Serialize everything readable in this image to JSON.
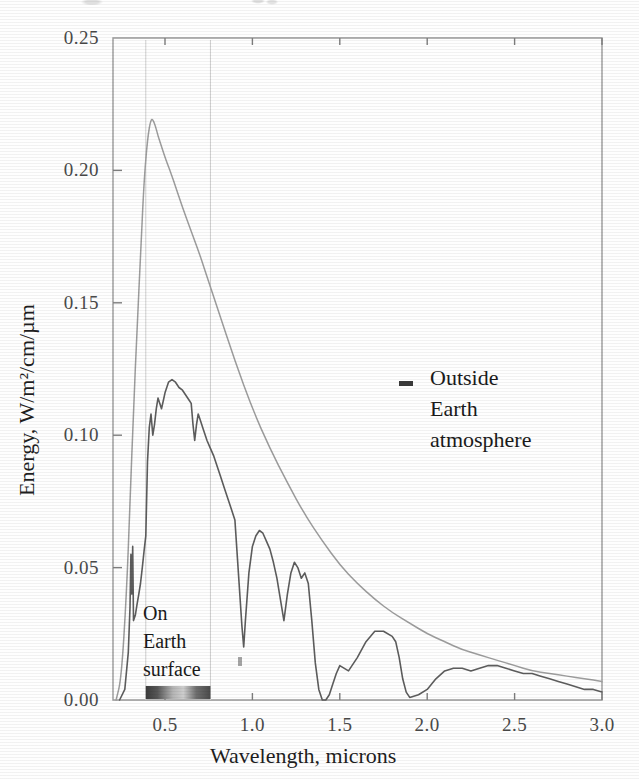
{
  "chart_data": {
    "type": "line",
    "title": "",
    "xlabel": "Wavelength, microns",
    "ylabel": "Energy, W/m²/cm/µm",
    "xlim": [
      0.2,
      3.0
    ],
    "ylim": [
      0.0,
      0.25
    ],
    "grid": "visible-band-only",
    "legend_position": "inline-annotations",
    "xticks": [
      "0.5",
      "1.0",
      "1.5",
      "2.0",
      "2.5",
      "3.0"
    ],
    "xtick_values": [
      0.5,
      1.0,
      1.5,
      2.0,
      2.5,
      3.0
    ],
    "yticks": [
      "0.00",
      "0.05",
      "0.10",
      "0.15",
      "0.20",
      "0.25"
    ],
    "ytick_values": [
      0.0,
      0.05,
      0.1,
      0.15,
      0.2,
      0.25
    ],
    "visible_band": {
      "label": "visible spectrum bar",
      "start": 0.39,
      "end": 0.76
    },
    "annotations": [
      {
        "name": "outside-earth-atmosphere",
        "lines": [
          "Outside",
          "Earth",
          "atmosphere"
        ],
        "x": 1.3,
        "y": 0.125
      },
      {
        "name": "on-earth-surface",
        "lines": [
          "On",
          "Earth",
          "surface"
        ],
        "x": 0.43,
        "y": 0.035
      }
    ],
    "series": [
      {
        "name": "Outside Earth atmosphere",
        "color": "#9d9d9d",
        "x": [
          0.22,
          0.25,
          0.28,
          0.3,
          0.32,
          0.34,
          0.36,
          0.38,
          0.4,
          0.42,
          0.44,
          0.46,
          0.48,
          0.5,
          0.55,
          0.6,
          0.65,
          0.7,
          0.75,
          0.8,
          0.9,
          1.0,
          1.1,
          1.2,
          1.3,
          1.4,
          1.5,
          1.6,
          1.7,
          1.8,
          1.9,
          2.0,
          2.1,
          2.2,
          2.3,
          2.4,
          2.5,
          2.6,
          2.7,
          2.8,
          2.9,
          3.0
        ],
        "y": [
          0.0,
          0.008,
          0.04,
          0.075,
          0.11,
          0.14,
          0.168,
          0.196,
          0.212,
          0.22,
          0.218,
          0.213,
          0.209,
          0.205,
          0.196,
          0.186,
          0.177,
          0.168,
          0.158,
          0.148,
          0.128,
          0.11,
          0.095,
          0.082,
          0.07,
          0.06,
          0.051,
          0.044,
          0.038,
          0.033,
          0.029,
          0.025,
          0.022,
          0.019,
          0.017,
          0.015,
          0.013,
          0.011,
          0.01,
          0.009,
          0.008,
          0.007
        ]
      },
      {
        "name": "On Earth surface",
        "color": "#5d5d5d",
        "x": [
          0.24,
          0.27,
          0.29,
          0.3,
          0.305,
          0.31,
          0.315,
          0.32,
          0.33,
          0.34,
          0.35,
          0.36,
          0.37,
          0.38,
          0.39,
          0.4,
          0.41,
          0.42,
          0.43,
          0.44,
          0.45,
          0.46,
          0.47,
          0.48,
          0.49,
          0.5,
          0.52,
          0.54,
          0.56,
          0.58,
          0.6,
          0.62,
          0.64,
          0.65,
          0.66,
          0.67,
          0.68,
          0.69,
          0.7,
          0.72,
          0.74,
          0.76,
          0.78,
          0.8,
          0.82,
          0.84,
          0.86,
          0.88,
          0.9,
          0.92,
          0.94,
          0.95,
          0.96,
          0.98,
          1.0,
          1.02,
          1.04,
          1.06,
          1.08,
          1.1,
          1.12,
          1.14,
          1.16,
          1.18,
          1.2,
          1.22,
          1.24,
          1.26,
          1.28,
          1.3,
          1.32,
          1.34,
          1.36,
          1.38,
          1.4,
          1.42,
          1.44,
          1.46,
          1.48,
          1.5,
          1.55,
          1.6,
          1.65,
          1.7,
          1.75,
          1.8,
          1.82,
          1.84,
          1.86,
          1.88,
          1.9,
          1.95,
          2.0,
          2.05,
          2.1,
          2.15,
          2.2,
          2.25,
          2.3,
          2.35,
          2.4,
          2.45,
          2.5,
          2.55,
          2.6,
          2.65,
          2.7,
          2.75,
          2.8,
          2.85,
          2.9,
          2.95,
          3.0
        ],
        "y": [
          0.0,
          0.004,
          0.018,
          0.035,
          0.055,
          0.04,
          0.058,
          0.03,
          0.032,
          0.036,
          0.04,
          0.044,
          0.05,
          0.056,
          0.062,
          0.09,
          0.103,
          0.108,
          0.1,
          0.104,
          0.11,
          0.114,
          0.112,
          0.11,
          0.113,
          0.116,
          0.12,
          0.121,
          0.12,
          0.118,
          0.117,
          0.115,
          0.113,
          0.112,
          0.104,
          0.098,
          0.104,
          0.108,
          0.106,
          0.102,
          0.098,
          0.095,
          0.092,
          0.088,
          0.084,
          0.08,
          0.076,
          0.072,
          0.068,
          0.048,
          0.028,
          0.02,
          0.03,
          0.048,
          0.058,
          0.062,
          0.064,
          0.063,
          0.06,
          0.057,
          0.052,
          0.046,
          0.038,
          0.03,
          0.04,
          0.048,
          0.052,
          0.05,
          0.046,
          0.048,
          0.044,
          0.03,
          0.014,
          0.004,
          0.0,
          0.0,
          0.002,
          0.006,
          0.01,
          0.013,
          0.011,
          0.016,
          0.022,
          0.026,
          0.026,
          0.024,
          0.022,
          0.016,
          0.008,
          0.003,
          0.001,
          0.002,
          0.004,
          0.008,
          0.011,
          0.012,
          0.012,
          0.011,
          0.012,
          0.013,
          0.013,
          0.012,
          0.011,
          0.01,
          0.01,
          0.009,
          0.008,
          0.007,
          0.006,
          0.005,
          0.004,
          0.004,
          0.003
        ]
      }
    ]
  }
}
